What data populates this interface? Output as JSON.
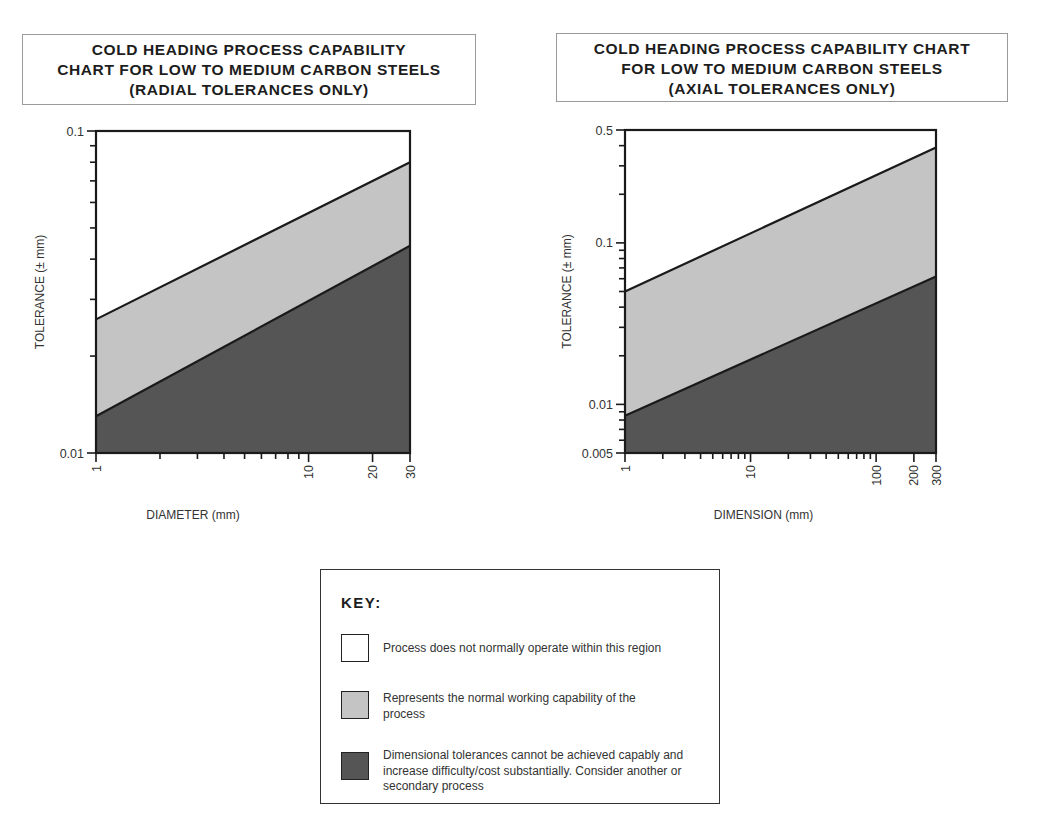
{
  "colors": {
    "white_region": "#ffffff",
    "light_region": "#c4c4c4",
    "dark_region": "#555555",
    "line": "#1a1a1a"
  },
  "charts": {
    "left": {
      "title_lines": [
        "COLD HEADING PROCESS CAPABILITY",
        "CHART FOR LOW TO MEDIUM CARBON STEELS",
        "(RADIAL TOLERANCES ONLY)"
      ],
      "xlabel": "DIAMETER (mm)",
      "ylabel": "TOLERANCE (± mm)",
      "x_tick_labels": [
        "1",
        "10",
        "20",
        "30"
      ],
      "y_tick_labels": [
        "0.1",
        "0.01"
      ]
    },
    "right": {
      "title_lines": [
        "COLD HEADING PROCESS CAPABILITY CHART",
        "FOR LOW TO MEDIUM CARBON STEELS",
        "(AXIAL TOLERANCES ONLY)"
      ],
      "xlabel": "DIMENSION (mm)",
      "ylabel": "TOLERANCE (± mm)",
      "x_tick_labels": [
        "1",
        "10",
        "100",
        "200",
        "300"
      ],
      "y_tick_labels": [
        "0.5",
        "0.1",
        "0.01",
        "0.005"
      ]
    }
  },
  "key": {
    "title": "KEY:",
    "items": [
      {
        "label": "Process does not normally operate within this region",
        "swatch": "white"
      },
      {
        "label": "Represents the normal working capability of the process",
        "swatch": "light-gray"
      },
      {
        "label": "Dimensional tolerances cannot be achieved capably and increase difficulty/cost substantially. Consider another or secondary process",
        "swatch": "dark-gray"
      }
    ]
  },
  "chart_data": [
    {
      "type": "area",
      "title": "COLD HEADING PROCESS CAPABILITY CHART FOR LOW TO MEDIUM CARBON STEELS (RADIAL TOLERANCES ONLY)",
      "xlabel": "DIAMETER (mm)",
      "ylabel": "TOLERANCE (± mm)",
      "xscale": "log",
      "yscale": "log",
      "xlim": [
        1,
        30
      ],
      "ylim": [
        0.01,
        0.1
      ],
      "x_ticks": [
        1,
        10,
        20,
        30
      ],
      "y_ticks": [
        0.01,
        0.1
      ],
      "grid": false,
      "series": [
        {
          "name": "Upper boundary (normal capability limit)",
          "x": [
            1,
            30
          ],
          "values": [
            0.026,
            0.08
          ]
        },
        {
          "name": "Lower boundary (difficult region limit)",
          "x": [
            1,
            30
          ],
          "values": [
            0.013,
            0.044
          ]
        }
      ],
      "regions": [
        {
          "name": "Process does not normally operate within this region",
          "fill": "white",
          "position": "above upper boundary"
        },
        {
          "name": "Represents the normal working capability of the process",
          "fill": "light-gray",
          "position": "between boundaries"
        },
        {
          "name": "Dimensional tolerances cannot be achieved capably",
          "fill": "dark-gray",
          "position": "below lower boundary"
        }
      ]
    },
    {
      "type": "area",
      "title": "COLD HEADING PROCESS CAPABILITY CHART FOR LOW TO MEDIUM CARBON STEELS (AXIAL TOLERANCES ONLY)",
      "xlabel": "DIMENSION (mm)",
      "ylabel": "TOLERANCE (± mm)",
      "xscale": "log",
      "yscale": "log",
      "xlim": [
        1,
        300
      ],
      "ylim": [
        0.005,
        0.5
      ],
      "x_ticks": [
        1,
        10,
        100,
        200,
        300
      ],
      "y_ticks": [
        0.005,
        0.01,
        0.1,
        0.5
      ],
      "grid": false,
      "series": [
        {
          "name": "Upper boundary (normal capability limit)",
          "x": [
            1,
            300
          ],
          "values": [
            0.05,
            0.39
          ]
        },
        {
          "name": "Lower boundary (difficult region limit)",
          "x": [
            1,
            300
          ],
          "values": [
            0.0085,
            0.062
          ]
        }
      ],
      "regions": [
        {
          "name": "Process does not normally operate within this region",
          "fill": "white",
          "position": "above upper boundary"
        },
        {
          "name": "Represents the normal working capability of the process",
          "fill": "light-gray",
          "position": "between boundaries"
        },
        {
          "name": "Dimensional tolerances cannot be achieved capably",
          "fill": "dark-gray",
          "position": "below lower boundary"
        }
      ]
    }
  ]
}
